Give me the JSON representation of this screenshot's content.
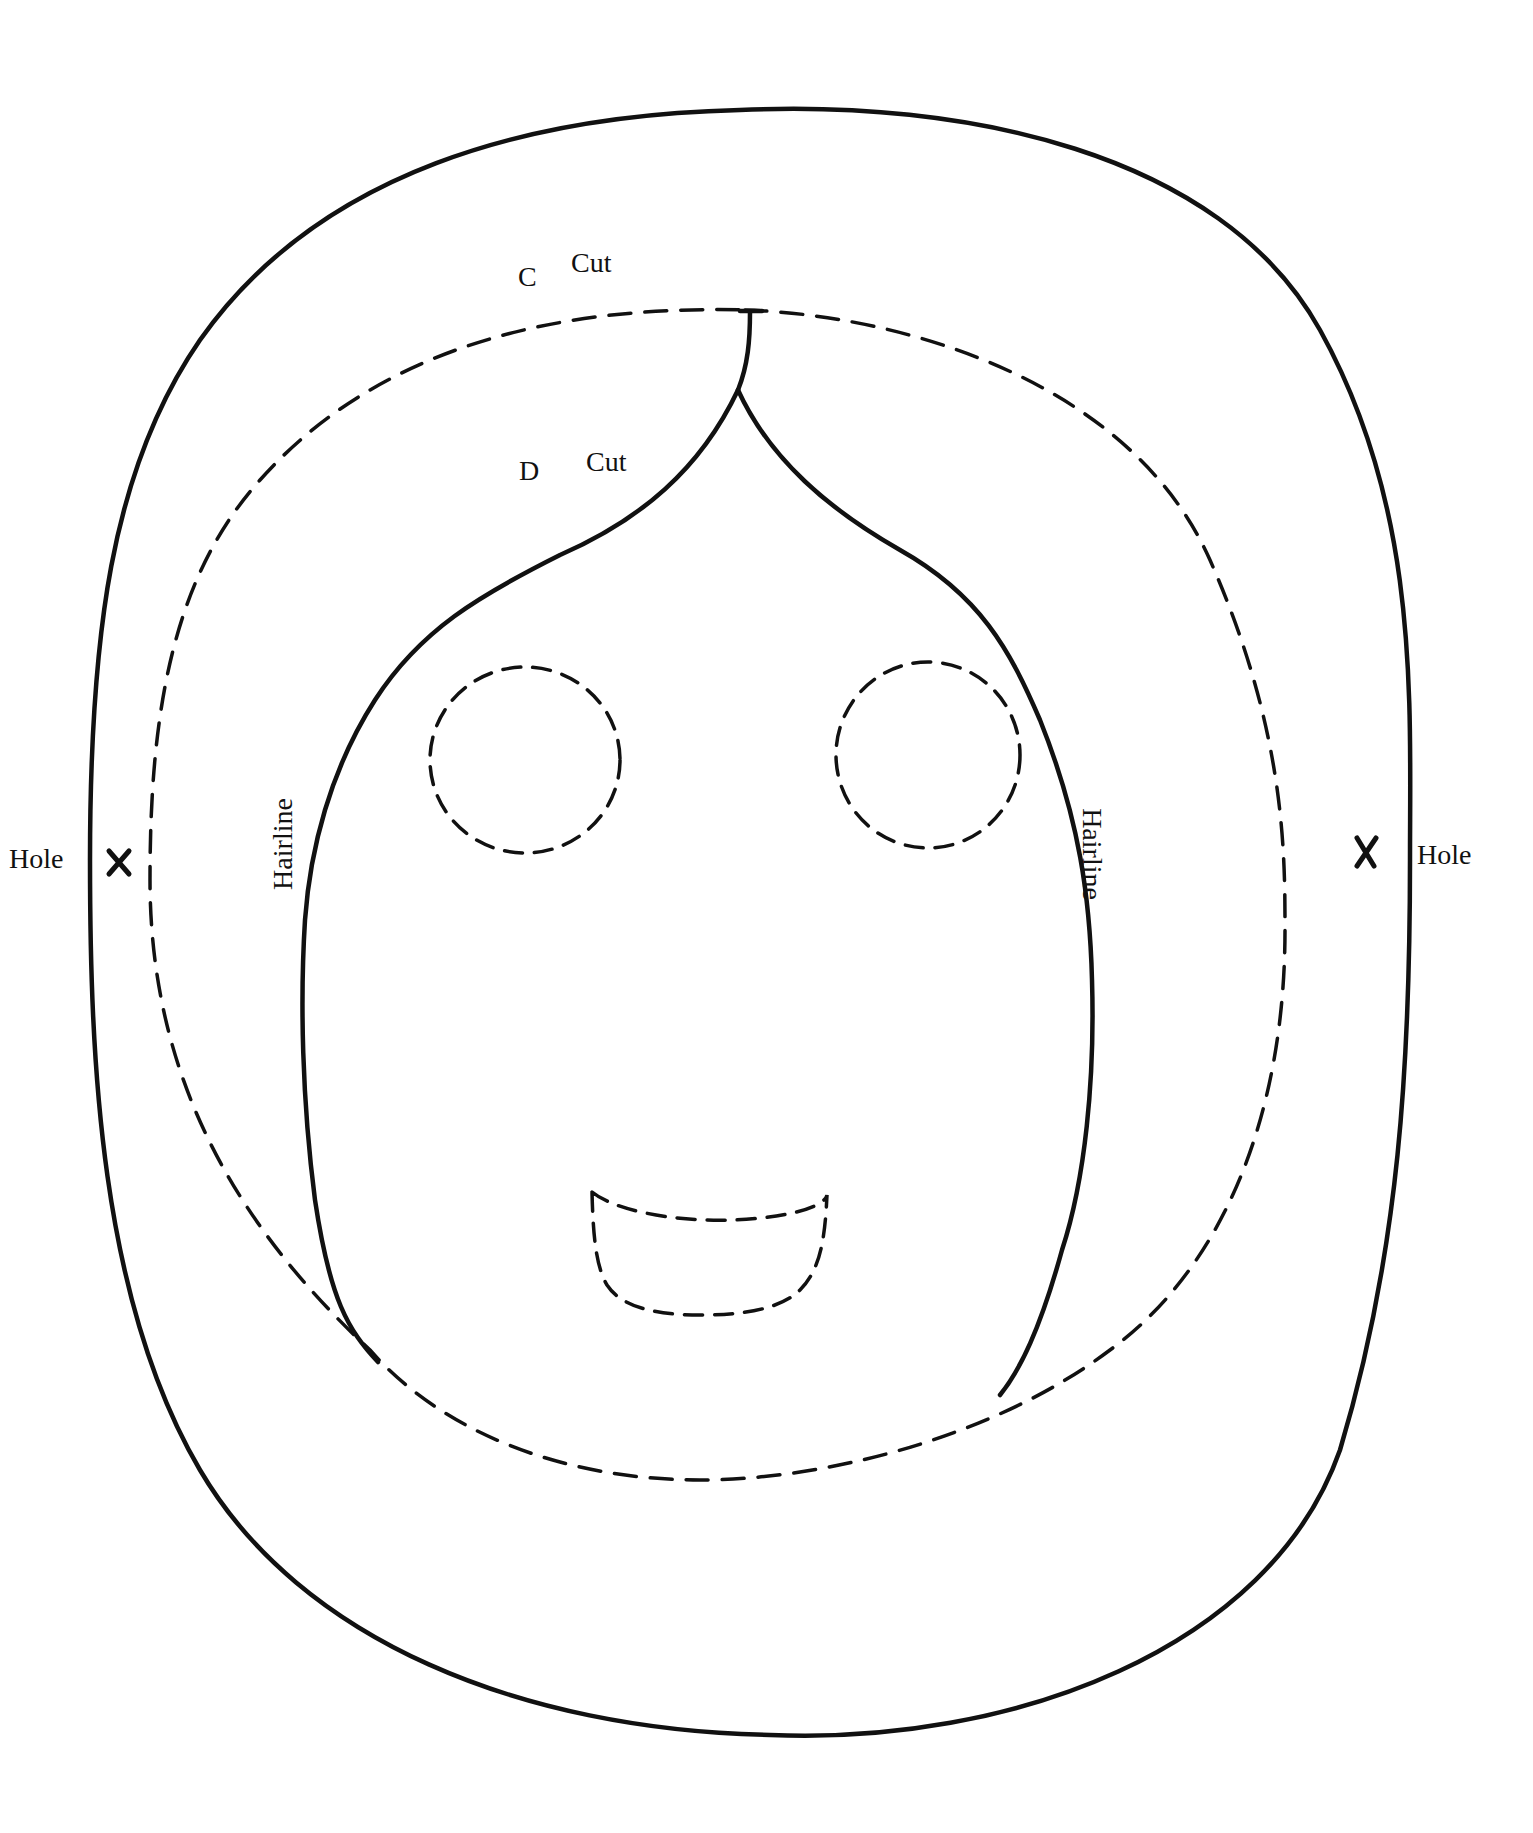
{
  "document": {
    "type": "craft mask pattern",
    "stroke_color": "#111111",
    "background_color": "#ffffff"
  },
  "labels": {
    "outer_cut": {
      "letter": "C",
      "text": "Cut"
    },
    "inner_cut": {
      "letter": "D",
      "text": "Cut"
    },
    "hole_left": "Hole",
    "hole_right": "Hole",
    "hairline_left": "Hairline",
    "hairline_right": "Hairline"
  },
  "marks": {
    "hole_left_symbol": "×",
    "hole_right_symbol": "×"
  },
  "shapes": {
    "outer_outline": "solid",
    "inner_oval": "dashed",
    "hair_face_outline": "solid",
    "eyes": [
      "dashed-circle",
      "dashed-circle"
    ],
    "mouth": "dashed"
  }
}
